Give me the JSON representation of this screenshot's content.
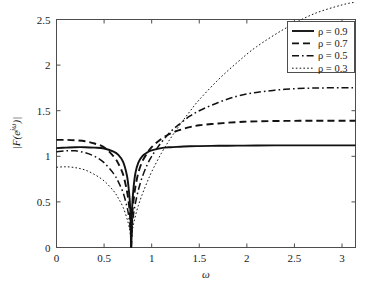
{
  "chart_data": {
    "type": "line",
    "title": "",
    "xlabel": "ω",
    "ylabel": "|F(e^{jω})|",
    "xlim": [
      0,
      3.1416
    ],
    "ylim": [
      0,
      2.5
    ],
    "grid": false,
    "legend_position": "top-right",
    "xticks": [
      0,
      0.5,
      1,
      1.5,
      2,
      2.5,
      3
    ],
    "xticklabels": [
      "0",
      "0.5",
      "1",
      "1.5",
      "2",
      "2.5",
      "3"
    ],
    "yticks": [
      0,
      0.5,
      1,
      1.5,
      2,
      2.5
    ],
    "yticklabels": [
      "0",
      "0.5",
      "1",
      "1.5",
      "2",
      "2.5"
    ],
    "notch_frequency": 0.785,
    "annotations": [
      "All four curves share a common zero (notch) at ω ≈ 0.785 (π/4)",
      "Curves cross near ω ≈ 1.3 at magnitude ≈ 1.1",
      "Larger ρ gives a narrower notch and flatter passband"
    ],
    "series": [
      {
        "name": "ρ = 0.9",
        "rho": 0.9,
        "style": "solid",
        "x": [
          0,
          0.1,
          0.2,
          0.3,
          0.4,
          0.5,
          0.6,
          0.65,
          0.7,
          0.74,
          0.76,
          0.775,
          0.785,
          0.795,
          0.81,
          0.83,
          0.86,
          0.9,
          0.95,
          1.0,
          1.1,
          1.2,
          1.3,
          1.4,
          1.5,
          1.7,
          1.9,
          2.1,
          2.4,
          2.7,
          3.0,
          3.1416
        ],
        "y": [
          1.09,
          1.095,
          1.1,
          1.1,
          1.095,
          1.085,
          1.05,
          1.015,
          0.94,
          0.79,
          0.63,
          0.42,
          0.0,
          0.44,
          0.66,
          0.82,
          0.93,
          1.0,
          1.04,
          1.065,
          1.09,
          1.1,
          1.105,
          1.11,
          1.112,
          1.115,
          1.117,
          1.118,
          1.12,
          1.12,
          1.12,
          1.12
        ]
      },
      {
        "name": "ρ = 0.7",
        "rho": 0.7,
        "style": "dashed",
        "x": [
          0,
          0.1,
          0.2,
          0.3,
          0.4,
          0.5,
          0.6,
          0.65,
          0.7,
          0.74,
          0.76,
          0.775,
          0.785,
          0.795,
          0.81,
          0.83,
          0.86,
          0.9,
          0.95,
          1.0,
          1.1,
          1.2,
          1.3,
          1.4,
          1.5,
          1.7,
          1.9,
          2.1,
          2.4,
          2.7,
          3.0,
          3.1416
        ],
        "y": [
          1.18,
          1.18,
          1.175,
          1.165,
          1.14,
          1.1,
          1.0,
          0.92,
          0.8,
          0.62,
          0.48,
          0.31,
          0.0,
          0.33,
          0.52,
          0.67,
          0.82,
          0.94,
          1.03,
          1.1,
          1.19,
          1.25,
          1.29,
          1.32,
          1.34,
          1.36,
          1.375,
          1.383,
          1.388,
          1.39,
          1.39,
          1.39
        ]
      },
      {
        "name": "ρ = 0.5",
        "rho": 0.5,
        "style": "dashdot",
        "x": [
          0,
          0.1,
          0.2,
          0.3,
          0.4,
          0.5,
          0.6,
          0.65,
          0.7,
          0.74,
          0.76,
          0.775,
          0.785,
          0.795,
          0.81,
          0.83,
          0.86,
          0.9,
          0.95,
          1.0,
          1.1,
          1.2,
          1.3,
          1.4,
          1.5,
          1.7,
          1.9,
          2.1,
          2.4,
          2.7,
          3.0,
          3.1416
        ],
        "y": [
          1.05,
          1.06,
          1.06,
          1.04,
          1.0,
          0.93,
          0.81,
          0.72,
          0.6,
          0.45,
          0.34,
          0.22,
          0.0,
          0.23,
          0.37,
          0.49,
          0.63,
          0.77,
          0.9,
          1.0,
          1.15,
          1.27,
          1.36,
          1.44,
          1.5,
          1.59,
          1.66,
          1.7,
          1.735,
          1.748,
          1.752,
          1.752
        ]
      },
      {
        "name": "ρ = 0.3",
        "rho": 0.3,
        "style": "dotted",
        "x": [
          0,
          0.1,
          0.2,
          0.3,
          0.4,
          0.5,
          0.6,
          0.65,
          0.7,
          0.74,
          0.76,
          0.775,
          0.785,
          0.795,
          0.81,
          0.83,
          0.86,
          0.9,
          0.95,
          1.0,
          1.1,
          1.2,
          1.3,
          1.4,
          1.5,
          1.7,
          1.9,
          2.1,
          2.4,
          2.7,
          3.0,
          3.1416
        ],
        "y": [
          0.88,
          0.885,
          0.875,
          0.85,
          0.8,
          0.73,
          0.62,
          0.54,
          0.44,
          0.32,
          0.24,
          0.155,
          0.0,
          0.16,
          0.26,
          0.35,
          0.46,
          0.58,
          0.71,
          0.83,
          1.03,
          1.2,
          1.35,
          1.49,
          1.62,
          1.84,
          2.03,
          2.2,
          2.4,
          2.56,
          2.66,
          2.69
        ]
      }
    ]
  },
  "legend": {
    "entries": [
      {
        "label": "ρ = 0.9",
        "style": "solid"
      },
      {
        "label": "ρ = 0.7",
        "style": "dashed"
      },
      {
        "label": "ρ = 0.5",
        "style": "dashdot"
      },
      {
        "label": "ρ = 0.3",
        "style": "dotted"
      }
    ]
  },
  "axis": {
    "x_title": "ω",
    "y_title_parts": {
      "bar_left": "|",
      "f": "F",
      "paren_open": "(",
      "e": "e",
      "exponent": "jω",
      "paren_close": ")",
      "bar_right": "|"
    }
  }
}
